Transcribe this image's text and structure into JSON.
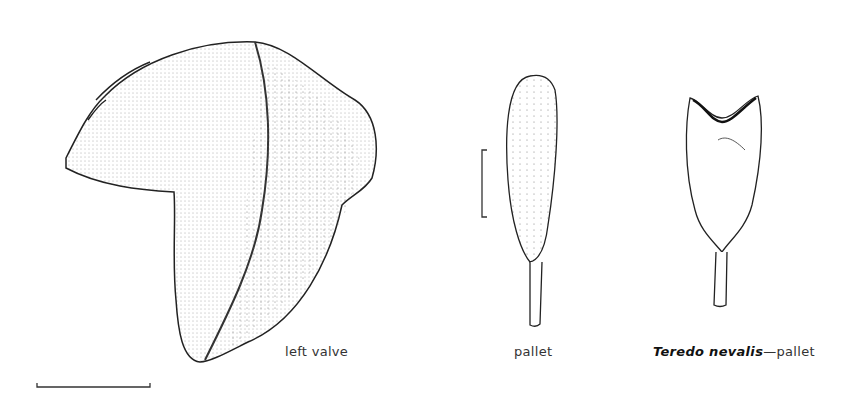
{
  "figure": {
    "drawings": [
      {
        "id": "left-valve",
        "label": "left valve"
      },
      {
        "id": "pallet",
        "label": "pallet"
      },
      {
        "id": "teredo-pallet",
        "species": "Teredo nevalis",
        "separator": "—",
        "label": "pallet"
      }
    ],
    "scale_bars": [
      {
        "id": "left-valve-scale",
        "orientation": "horizontal"
      },
      {
        "id": "pallet-scale",
        "orientation": "vertical"
      }
    ],
    "colors": {
      "ink": "#2a2a2a",
      "stipple": "#555555",
      "background": "#ffffff"
    }
  }
}
